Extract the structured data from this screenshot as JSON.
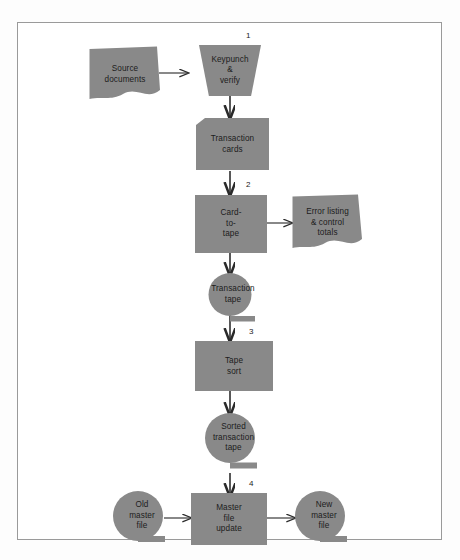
{
  "figure": {
    "kind": "systems-flowchart",
    "fill_color": "#898989",
    "text_color": "#1c1c1c",
    "frame_color": "#9a9a9a",
    "page_background": "#fdfdfd"
  },
  "nodes": [
    {
      "id": "source-documents",
      "label": "Source\ndocuments",
      "shape": "document",
      "step": null
    },
    {
      "id": "keypunch-verify",
      "label": "Keypunch\n&\nverify",
      "shape": "manual-operation",
      "step": "1"
    },
    {
      "id": "transaction-cards",
      "label": "Transaction\ncards",
      "shape": "punched-card",
      "step": null
    },
    {
      "id": "card-to-tape",
      "label": "Card-\nto-\ntape",
      "shape": "process",
      "step": "2"
    },
    {
      "id": "error-listing",
      "label": "Error listing\n& control\ntotals",
      "shape": "document",
      "step": null
    },
    {
      "id": "transaction-tape",
      "label": "Transaction\ntape",
      "shape": "magnetic-tape",
      "step": null
    },
    {
      "id": "tape-sort",
      "label": "Tape\nsort",
      "shape": "process",
      "step": "3"
    },
    {
      "id": "sorted-transaction-tape",
      "label": "Sorted\ntransaction\ntape",
      "shape": "magnetic-tape",
      "step": null
    },
    {
      "id": "old-master-file",
      "label": "Old\nmaster\nfile",
      "shape": "magnetic-tape",
      "step": null
    },
    {
      "id": "master-file-update",
      "label": "Master\nfile\nupdate",
      "shape": "process",
      "step": "4"
    },
    {
      "id": "new-master-file",
      "label": "New\nmaster\nfile",
      "shape": "magnetic-tape",
      "step": null
    }
  ],
  "connectors": [
    {
      "from": "source-documents",
      "to": "keypunch-verify",
      "direction": "right"
    },
    {
      "from": "keypunch-verify",
      "to": "transaction-cards",
      "direction": "down"
    },
    {
      "from": "transaction-cards",
      "to": "card-to-tape",
      "direction": "down"
    },
    {
      "from": "card-to-tape",
      "to": "error-listing",
      "direction": "right"
    },
    {
      "from": "card-to-tape",
      "to": "transaction-tape",
      "direction": "down"
    },
    {
      "from": "transaction-tape",
      "to": "tape-sort",
      "direction": "down"
    },
    {
      "from": "tape-sort",
      "to": "sorted-transaction-tape",
      "direction": "down"
    },
    {
      "from": "sorted-transaction-tape",
      "to": "master-file-update",
      "direction": "down"
    },
    {
      "from": "old-master-file",
      "to": "master-file-update",
      "direction": "right"
    },
    {
      "from": "master-file-update",
      "to": "new-master-file",
      "direction": "right"
    }
  ],
  "step_numbers": [
    "1",
    "2",
    "3",
    "4"
  ]
}
